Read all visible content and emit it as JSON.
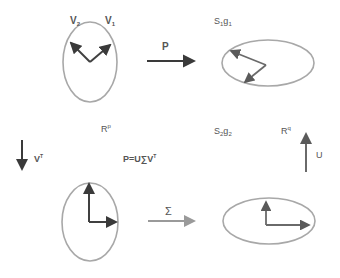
{
  "colors": {
    "ellipse": "#a8a8a8",
    "vector_dark": "#404040",
    "vector_mid": "#6a6a6a",
    "arrow_dark": "#3a3a3a",
    "arrow_light": "#9a9a9a",
    "label": "#555555",
    "label_light": "#8a8a8a"
  },
  "labels": {
    "v2": "V",
    "v2_sub": "2",
    "v1": "V",
    "v1_sub": "1",
    "p_arrow": "P",
    "s1g1_s": "S",
    "s1g1_1": "1",
    "s1g1_g": "g",
    "s1g1_2": "1",
    "rp": "R",
    "rp_sup": "p",
    "vt": "V",
    "vt_sup": "T",
    "equation": "P=U∑V",
    "equation_sup": "T",
    "s2g2_s": "S",
    "s2g2_1": "2",
    "s2g2_g": "g",
    "s2g2_2": "2",
    "rq": "R",
    "rq_sup": "q",
    "u": "U",
    "sigma": "Σ"
  },
  "panels": [
    {
      "name": "input-space",
      "description": "unit ellipse with vectors V1, V2"
    },
    {
      "name": "output-space",
      "description": "ellipse with transformed vectors"
    },
    {
      "name": "rotated-input",
      "description": "ellipse with axis-aligned vectors after V^T"
    },
    {
      "name": "scaled",
      "description": "ellipse with axis-aligned vectors after Σ scaling"
    }
  ]
}
